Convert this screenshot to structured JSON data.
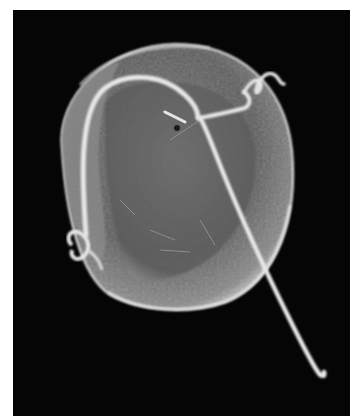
{
  "image": {
    "subject": "scanning electron micrograph of a flagellated single-celled organism",
    "background_color": "#050505",
    "page_background": "#ffffff",
    "body_color": "#6e6e6e",
    "highlight_color": "#e8e8e8"
  }
}
